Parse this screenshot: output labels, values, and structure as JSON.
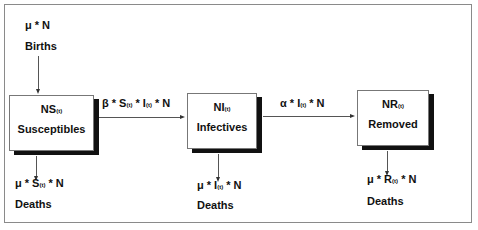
{
  "diagram": {
    "type": "SIR compartment model flow diagram",
    "births": {
      "rate": "μ * N",
      "label": "Births"
    },
    "compartments": [
      {
        "id": "S",
        "symbol": "NS",
        "subscript": "(t)",
        "label": "Susceptibles"
      },
      {
        "id": "I",
        "symbol": "NI",
        "subscript": "(t)",
        "label": "Infectives"
      },
      {
        "id": "R",
        "symbol": "NR",
        "subscript": "(t)",
        "label": "Removed"
      }
    ],
    "transitions": {
      "infection": {
        "pre": "β * S",
        "sub1": "(t)",
        "mid": " * I",
        "sub2": "(t)",
        "post": " * N"
      },
      "removal": {
        "pre": "α * I",
        "sub1": "(t)",
        "post": " * N"
      }
    },
    "deaths": [
      {
        "pre": "μ * S",
        "sub": "(t)",
        "post": " * N",
        "label": "Deaths"
      },
      {
        "pre": "μ * I",
        "sub": "(t)",
        "post": " * N",
        "label": "Deaths"
      },
      {
        "pre": "μ * R",
        "sub": "(t)",
        "post": " * N",
        "label": "Deaths"
      }
    ]
  }
}
